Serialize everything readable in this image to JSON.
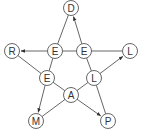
{
  "diagram": {
    "title": "",
    "type": "pentagram-graph",
    "colors": {
      "stroke": "#555555",
      "text": "#333333",
      "background": "#ffffff"
    },
    "nodes": [
      {
        "id": "D",
        "label": "D",
        "x": 71,
        "y": 8
      },
      {
        "id": "E1",
        "label": "E",
        "x": 55,
        "y": 51
      },
      {
        "id": "E2",
        "label": "E",
        "x": 84,
        "y": 51
      },
      {
        "id": "R",
        "label": "R",
        "x": 12,
        "y": 51
      },
      {
        "id": "L1",
        "label": "L",
        "x": 130,
        "y": 51
      },
      {
        "id": "E3",
        "label": "E",
        "x": 47,
        "y": 78
      },
      {
        "id": "L2",
        "label": "L",
        "x": 94,
        "y": 78
      },
      {
        "id": "A",
        "label": "A",
        "x": 71,
        "y": 95
      },
      {
        "id": "M",
        "label": "M",
        "x": 36,
        "y": 121
      },
      {
        "id": "P",
        "label": "P",
        "x": 108,
        "y": 121
      }
    ],
    "edges": [
      {
        "from": "D",
        "to": "E1",
        "arrow": false
      },
      {
        "from": "E2",
        "to": "D",
        "arrow": true
      },
      {
        "from": "E1",
        "to": "R",
        "arrow": true
      },
      {
        "from": "E1",
        "to": "E2",
        "arrow": false
      },
      {
        "from": "E2",
        "to": "L1",
        "arrow": false
      },
      {
        "from": "R",
        "to": "E3",
        "arrow": false
      },
      {
        "from": "E1",
        "to": "E3",
        "arrow": false
      },
      {
        "from": "E2",
        "to": "L2",
        "arrow": false
      },
      {
        "from": "L2",
        "to": "L1",
        "arrow": true
      },
      {
        "from": "E3",
        "to": "M",
        "arrow": true
      },
      {
        "from": "E3",
        "to": "A",
        "arrow": false
      },
      {
        "from": "A",
        "to": "L2",
        "arrow": false
      },
      {
        "from": "A",
        "to": "P",
        "arrow": true
      },
      {
        "from": "M",
        "to": "A",
        "arrow": false
      },
      {
        "from": "L2",
        "to": "P",
        "arrow": false
      }
    ]
  }
}
